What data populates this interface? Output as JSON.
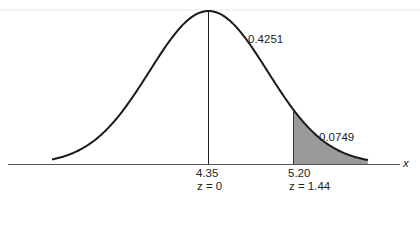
{
  "chart_data": {
    "type": "area",
    "title": "",
    "distribution": "normal",
    "xlabel": "x",
    "ylabel": "",
    "mean": 4.35,
    "mean_label": "4.35",
    "mean_z_label": "z = 0",
    "cutoff": 5.2,
    "cutoff_label": "5.20",
    "cutoff_z": 1.44,
    "cutoff_z_label": "z = 1.44",
    "areas": [
      {
        "region": "mean to 5.20",
        "value": 0.4251,
        "label": "0.4251",
        "shaded": false
      },
      {
        "region": "above 5.20",
        "value": 0.0749,
        "label": "0.0749",
        "shaded": true
      }
    ],
    "grid": false,
    "legend": null,
    "colors": {
      "curve": "#1a1a1a",
      "shade": "#9a9a9a",
      "axis": "#555555"
    }
  },
  "labels": {
    "area_center": "0.4251",
    "area_tail": "0.0749",
    "mean_value": "4.35",
    "mean_z": "z = 0",
    "cutoff_value": "5.20",
    "cutoff_z": "z = 1.44",
    "axis_x": "x"
  }
}
